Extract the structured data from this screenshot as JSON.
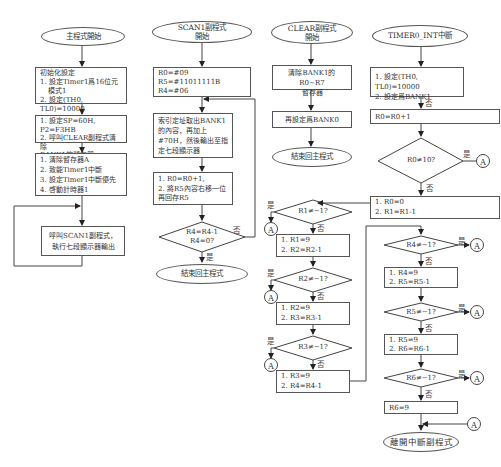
{
  "main": {
    "start": "主程式開始",
    "init_title": "初始化設定",
    "init_1": "1. 設定Timer1爲16位元",
    "init_1b": "模式1",
    "init_2": "2. 設定(TH0, TL0)=10000",
    "step2_1": "1. 設定SP=60H, P2=F3HB",
    "step2_2": "2. 呼叫CLEAR副程式清除",
    "step2_3": "BANK1的暫存器",
    "step3_1": "1. 清除暫存器A",
    "step3_2": "2. 致能Timer1中斷",
    "step3_3": "3. 設定Timer1中斷優先",
    "step3_4": "4. 啓動計時器1",
    "loop_1": "呼叫SCAN1副程式，",
    "loop_2": "執行七段顯示器輸出"
  },
  "scan1": {
    "start_1": "SCAN1副程式",
    "start_2": "開始",
    "init_1": "R0=#09",
    "init_2": "R5=#11011111B",
    "init_3": "R4=#06",
    "fetch_1": "索引定址取出BANK1",
    "fetch_2": "的內容，再加上",
    "fetch_3": "#70H，然後輸出至指",
    "fetch_4": "定七段顯示器",
    "shift_1": "1. R0=R0+1,",
    "shift_2": "2. 將R5內容右移一位",
    "shift_3": "再回存R5",
    "dec_1": "R4=R4-1",
    "dec_2": "R4=0?",
    "no": "否",
    "yes": "是",
    "end": "結束回主程式"
  },
  "clear": {
    "start_1": "CLEAR副程式",
    "start_2": "開始",
    "step1_1": "清除BANK1的R0~R7",
    "step1_2": "暫存器",
    "step2": "再設定爲BANK0",
    "end": "結束回主程式",
    "r1_cond": "R1≠−1?",
    "r1_box_1": "1.  R1=9",
    "r1_box_2": "2.  R2=R2-1",
    "r2_cond": "R2≠−1?",
    "r2_box_1": "1.  R2=9",
    "r2_box_2": "2.  R3=R3-1",
    "r3_cond": "R3≠−1?",
    "r3_box_1": "1.  R3=9",
    "r3_box_2": "2.  R4=R4-1"
  },
  "timer": {
    "start": "TIMER0_INT中斷",
    "step1_1": "1. 設定(TH0, TL0)=10000",
    "step1_2": "2. 設定爲BANK1",
    "inc": "R0=R0+1",
    "r0_cond": "R0≠10?",
    "reset_1": "1.  R0=0",
    "reset_2": "2.  R1=R1-1",
    "r4_cond": "R4≠−1?",
    "r4_box_1": "1.  R4=9",
    "r4_box_2": "2.  R5=R5-1",
    "r5_cond": "R5≠−1?",
    "r5_box_1": "1.  R5=9",
    "r5_box_2": "2.  R6=R6-1",
    "r6_cond": "R6≠−1?",
    "r6_box": "R6=9",
    "end": "離開中斷副程式"
  },
  "labels": {
    "yes": "是",
    "no": "否",
    "connector": "A"
  }
}
